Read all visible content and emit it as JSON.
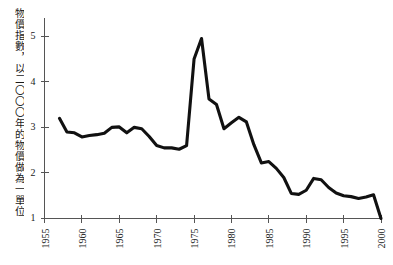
{
  "chart_data": {
    "type": "line",
    "title": "",
    "subtitle": "",
    "xlabel": "",
    "ylabel": "物價指數，以二〇〇〇年的物價做為一單位",
    "xlim": [
      1955,
      2000
    ],
    "ylim": [
      1,
      5.4
    ],
    "grid": false,
    "legend": null,
    "x_ticks": [
      1955,
      1960,
      1965,
      1970,
      1975,
      1980,
      1985,
      1990,
      1995,
      2000
    ],
    "x_tick_labels": [
      "1955",
      "1960",
      "1965",
      "1970",
      "1975",
      "1980",
      "1985",
      "1990",
      "1995",
      "2000"
    ],
    "y_ticks": [
      1,
      2,
      3,
      4,
      5
    ],
    "y_tick_labels": [
      "1",
      "2",
      "3",
      "4",
      "5"
    ],
    "series": [
      {
        "name": "物價指數",
        "color": "#111111",
        "x": [
          1957,
          1958,
          1959,
          1960,
          1961,
          1962,
          1963,
          1964,
          1965,
          1966,
          1967,
          1968,
          1969,
          1970,
          1971,
          1972,
          1973,
          1974,
          1975,
          1976,
          1977,
          1978,
          1979,
          1980,
          1981,
          1982,
          1983,
          1984,
          1985,
          1986,
          1987,
          1988,
          1989,
          1990,
          1991,
          1992,
          1993,
          1994,
          1995,
          1996,
          1997,
          1998,
          1999,
          2000
        ],
        "values": [
          3.2,
          2.9,
          2.88,
          2.79,
          2.82,
          2.84,
          2.87,
          3.0,
          3.01,
          2.88,
          3.0,
          2.97,
          2.8,
          2.6,
          2.55,
          2.55,
          2.52,
          2.6,
          4.5,
          4.95,
          3.62,
          3.5,
          2.97,
          3.1,
          3.22,
          3.12,
          2.62,
          2.22,
          2.25,
          2.1,
          1.9,
          1.55,
          1.53,
          1.62,
          1.88,
          1.85,
          1.68,
          1.56,
          1.5,
          1.48,
          1.44,
          1.47,
          1.52,
          1.0
        ]
      }
    ],
    "annotations": []
  },
  "axis": {
    "y_title": "物價指數，以二〇〇〇年的物價做為一單位"
  }
}
